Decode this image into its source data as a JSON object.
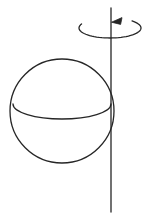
{
  "figure": {
    "background_color": "#ffffff",
    "stroke_color": "#262626",
    "width": 149,
    "height": 221,
    "has_labels": false,
    "caption": ""
  },
  "sphere": {
    "name": "sphere-outline",
    "description": "circle representing a sphere",
    "center_x": 62,
    "center_y": 111,
    "radius": 52,
    "stroke_color": "#262626",
    "stroke_width": 1.3,
    "fill": "none"
  },
  "equator": {
    "name": "equator-arc",
    "description": "lower half of an ellipse drawn across the sphere as the equator, indicating a viewpoint slightly above the equatorial plane",
    "center_x": 62,
    "center_y": 104,
    "radius_x": 49,
    "radius_y": 15,
    "visible_half": "lower",
    "stroke_color": "#262626",
    "stroke_width": 1.3
  },
  "axis": {
    "name": "rotation-axis-line",
    "description": "vertical line through the sphere marking the axis of rotation",
    "x": 111,
    "y_top": 8,
    "y_bottom": 212,
    "stroke_color": "#262626",
    "stroke_width": 1.3
  },
  "rotation_arrow": {
    "name": "rotation-direction-arrow",
    "description": "open elliptical arc encircling the axis above the sphere with an arrowhead showing the sense of rotation",
    "center_x": 110,
    "center_y": 28,
    "radius_x": 31,
    "radius_y": 10,
    "direction": "counterclockwise-viewed-from-above",
    "arrowhead_x": 117,
    "arrowhead_y": 21,
    "arrowhead_points_toward": "left",
    "stroke_color": "#262626",
    "stroke_width": 1.3
  },
  "colors": {
    "ink": "#262626",
    "paper": "#ffffff"
  }
}
